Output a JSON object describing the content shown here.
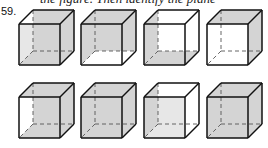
{
  "header": {
    "clipped_text": "the figure. Then identify the plane"
  },
  "problem": {
    "number": "59."
  },
  "colors": {
    "shade": "#d4d4d4",
    "edge": "#111111",
    "hidden_edge": "#555555",
    "background": "#ffffff"
  },
  "cube_geometry": {
    "size": 41,
    "depth_offset_x": 14,
    "depth_offset_y": -14
  },
  "cubes": [
    {
      "id": 1,
      "x": 19,
      "y": 24,
      "shaded": [
        "back",
        "bottom",
        "right",
        "front"
      ]
    },
    {
      "id": 2,
      "x": 81,
      "y": 24,
      "shaded": [
        "back",
        "top",
        "left"
      ]
    },
    {
      "id": 3,
      "x": 144,
      "y": 24,
      "shaded": [
        "left",
        "bottom"
      ]
    },
    {
      "id": 4,
      "x": 207,
      "y": 24,
      "shaded": [
        "top",
        "right"
      ]
    },
    {
      "id": 5,
      "x": 19,
      "y": 97,
      "shaded": [
        "back",
        "top",
        "right",
        "bottom"
      ]
    },
    {
      "id": 6,
      "x": 81,
      "y": 97,
      "shaded": [
        "back",
        "top",
        "left",
        "right",
        "bottom",
        "front"
      ]
    },
    {
      "id": 7,
      "x": 144,
      "y": 97,
      "shaded": [
        "left",
        "front"
      ]
    },
    {
      "id": 8,
      "x": 207,
      "y": 97,
      "shaded": [
        "back",
        "top",
        "left",
        "right",
        "bottom"
      ]
    }
  ]
}
